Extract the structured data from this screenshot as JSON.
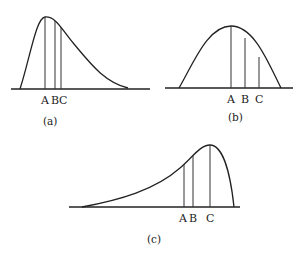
{
  "figure": {
    "panels": [
      {
        "id": "a",
        "caption": "(a)",
        "shape": "positively skewed",
        "markers": [
          {
            "label": "A",
            "position": "mode"
          },
          {
            "label": "B",
            "position": "median"
          },
          {
            "label": "C",
            "position": "mean"
          }
        ],
        "marker_labels": [
          "A",
          "B",
          "C"
        ]
      },
      {
        "id": "b",
        "caption": "(b)",
        "shape": "symmetric",
        "markers": [
          {
            "label": "A"
          },
          {
            "label": "B"
          },
          {
            "label": "C"
          }
        ],
        "marker_labels": [
          "A",
          "B",
          "C"
        ]
      },
      {
        "id": "c",
        "caption": "(c)",
        "shape": "negatively skewed",
        "markers": [
          {
            "label": "A"
          },
          {
            "label": "B"
          },
          {
            "label": "C"
          }
        ],
        "marker_labels": [
          "A",
          "B",
          "C"
        ]
      }
    ]
  }
}
